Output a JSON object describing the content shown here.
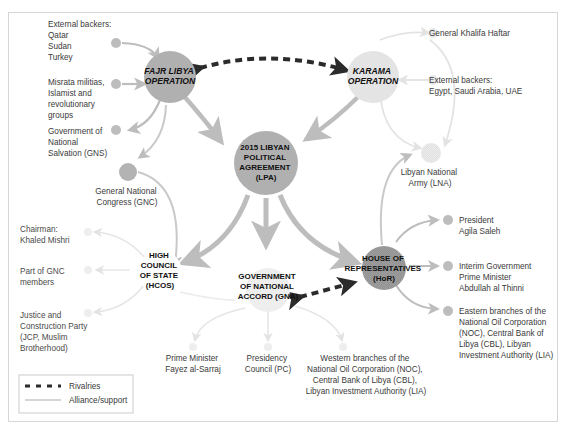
{
  "diagram": {
    "hubs": {
      "fajr": {
        "lines": [
          "FAJR LIBYA",
          "OPERATION"
        ]
      },
      "karama": {
        "lines": [
          "KARAMA",
          "OPERATION"
        ]
      },
      "lpa": {
        "lines": [
          "2015 LIBYAN",
          "POLITICAL",
          "AGREEMENT",
          "(LPA)"
        ]
      },
      "hcos": {
        "lines": [
          "HIGH",
          "COUNCIL",
          "OF STATE",
          "(HCOS)"
        ]
      },
      "gna": {
        "lines": [
          "GOVERNMENT",
          "OF NATIONAL",
          "ACCORD (GNA)"
        ]
      },
      "hor": {
        "lines": [
          "HOUSE OF",
          "REPRESENTATIVES",
          "(HoR)"
        ]
      }
    },
    "nodes": {
      "fajr_backers": {
        "lines": [
          "External backers:",
          "Qatar",
          "Sudan",
          "Turkey"
        ]
      },
      "misrata": {
        "lines": [
          "Misrata militias,",
          "Islamist and",
          "revolutionary",
          "groups"
        ]
      },
      "gns": {
        "lines": [
          "Government of",
          "National",
          "Salvation (GNS)"
        ]
      },
      "gnc": {
        "lines": [
          "General National",
          "Congress (GNC)"
        ]
      },
      "haftar": {
        "lines": [
          "General Khalifa Haftar"
        ]
      },
      "karama_backers": {
        "lines": [
          "External backers:",
          "Egypt, Saudi Arabia, UAE"
        ]
      },
      "lna": {
        "lines": [
          "Libyan National",
          "Army (LNA)"
        ]
      },
      "mishri": {
        "lines": [
          "Chairman:",
          "Khaled Mishri"
        ]
      },
      "gnc_members": {
        "lines": [
          "Part of GNC",
          "members"
        ]
      },
      "jcp": {
        "lines": [
          "Justice and",
          "Construction Party",
          "(JCP, Muslim",
          "Brotherhood)"
        ]
      },
      "sarraj": {
        "lines": [
          "Prime Minister",
          "Fayez al-Sarraj"
        ]
      },
      "pc": {
        "lines": [
          "Presidency",
          "Council (PC)"
        ]
      },
      "western": {
        "lines": [
          "Western branches of the",
          "National Oil Corporation (NOC),",
          "Central Bank of Libya (CBL),",
          "Libyan Investment Authority (LIA)"
        ]
      },
      "saleh": {
        "lines": [
          "President",
          "Agila Saleh"
        ]
      },
      "thinni": {
        "lines": [
          "Interim Government",
          "Prime Minister",
          "Abdullah al Thinni"
        ]
      },
      "eastern": {
        "lines": [
          "Eastern branches of the",
          "National Oil Corporation",
          "(NOC), Central Bank of",
          "Libya (CBL), Libyan",
          "Investment Authority (LIA)"
        ]
      }
    },
    "legend": {
      "rivalries": "Rivalries",
      "alliance": "Alliance/support"
    },
    "colors": {
      "hub_dark": "#a9a9a9",
      "hub_light": "#d9d9d9",
      "arrow_strong": "#bdbdbd",
      "arrow_faint": "#e3e3e3",
      "rivalry": "#2b2b2b",
      "frame": "#d6d6d6"
    }
  }
}
